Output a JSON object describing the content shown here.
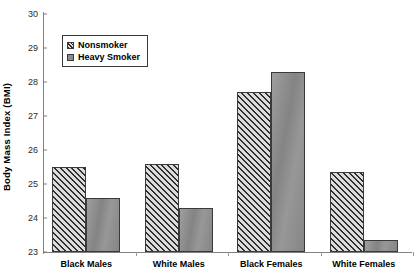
{
  "chart_data": {
    "type": "bar",
    "title": "",
    "xlabel": "",
    "ylabel": "Body Mass Index (BMI)",
    "categories": [
      "Black Males",
      "White Males",
      "Black Females",
      "White Females"
    ],
    "series": [
      {
        "name": "Nonsmoker",
        "values": [
          25.5,
          25.6,
          27.7,
          25.35
        ]
      },
      {
        "name": "Heavy Smoker",
        "values": [
          24.6,
          24.3,
          28.3,
          23.35
        ]
      }
    ],
    "ylim": [
      23,
      30
    ],
    "yticks": [
      23,
      24,
      25,
      26,
      27,
      28,
      29,
      30
    ],
    "ytick_labels": [
      "23",
      "24",
      "25",
      "26",
      "27",
      "28",
      "29",
      "30"
    ],
    "grid": false,
    "legend_position": "upper-left-inside",
    "colors": {
      "nonsmoker": "#dcdcdc",
      "heavy_smoker": "#8c8c8c",
      "axis": "#808080",
      "text": "#000000"
    }
  },
  "legend": {
    "items": [
      {
        "label": "Nonsmoker",
        "swatch": "hatched-swatch-icon"
      },
      {
        "label": "Heavy Smoker",
        "swatch": "solid-swatch-icon"
      }
    ]
  }
}
